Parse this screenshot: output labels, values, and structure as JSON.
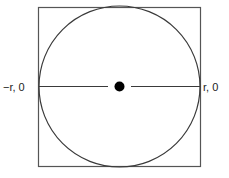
{
  "diagram": {
    "labels": {
      "left": "−r, 0",
      "right": "r, 0"
    },
    "colors": {
      "stroke": "#3a3a3a",
      "square_stroke": "#555555",
      "dot": "#000000"
    }
  }
}
